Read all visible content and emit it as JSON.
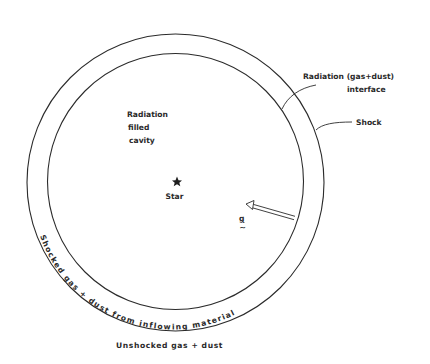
{
  "diagram": {
    "type": "schematic",
    "labels": {
      "interface_line1": "Radiation (gas+dust)",
      "interface_line2": "interface",
      "shock": "Shock",
      "cavity_line1": "Radiation",
      "cavity_line2": "filled",
      "cavity_line3": "cavity",
      "star": "Star",
      "gravity_symbol": "g",
      "gravity_tilde": "~",
      "shell_text": "Shocked gas + dust from inflowing material",
      "outer_region": "Unshocked gas + dust"
    },
    "geometry": {
      "outer_circle": {
        "cx": 175.5,
        "cy": 182.5,
        "r": 148.5,
        "meaning": "Shock"
      },
      "inner_circle": {
        "cx": 175.5,
        "cy": 181.5,
        "r": 128,
        "meaning": "Radiation (gas+dust) interface"
      },
      "star": {
        "x": 177,
        "y": 182
      },
      "arrow": {
        "from": [
          295,
          218
        ],
        "to": [
          246,
          204
        ],
        "style": "double-line hollow arrow"
      }
    },
    "colors": {
      "line": "#2b2b2b",
      "text": "#2a2a2a",
      "background": "#ffffff"
    }
  }
}
